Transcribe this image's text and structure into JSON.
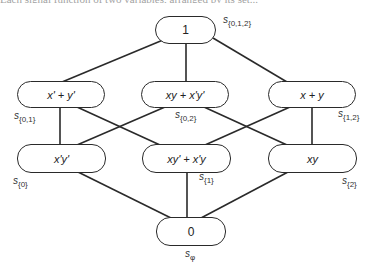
{
  "header_fragment": "Each signal function of two variables, arranged by its set...",
  "diagram": {
    "type": "lattice",
    "nodes": [
      {
        "id": "top",
        "text": "1",
        "label_base": "s",
        "label_sub": "{0,1,2}"
      },
      {
        "id": "m_left",
        "text": "x' + y'",
        "label_base": "s",
        "label_sub": "{0,1}"
      },
      {
        "id": "m_center",
        "text": "xy + x'y'",
        "label_base": "s",
        "label_sub": "{0,2}"
      },
      {
        "id": "m_right",
        "text": "x + y",
        "label_base": "s",
        "label_sub": "{1,2}"
      },
      {
        "id": "b_left",
        "text": "x'y'",
        "label_base": "s",
        "label_sub": "{0}"
      },
      {
        "id": "b_center",
        "text": "xy' + x'y",
        "label_base": "s",
        "label_sub": "{1}"
      },
      {
        "id": "b_right",
        "text": "xy",
        "label_base": "s",
        "label_sub": "{2}"
      },
      {
        "id": "bottom",
        "text": "0",
        "label_base": "s",
        "label_sub": "φ"
      }
    ],
    "edges": [
      [
        "top",
        "m_left"
      ],
      [
        "top",
        "m_center"
      ],
      [
        "top",
        "m_right"
      ],
      [
        "m_left",
        "b_left"
      ],
      [
        "m_left",
        "b_center"
      ],
      [
        "m_center",
        "b_left"
      ],
      [
        "m_center",
        "b_right"
      ],
      [
        "m_right",
        "b_center"
      ],
      [
        "m_right",
        "b_right"
      ],
      [
        "b_left",
        "bottom"
      ],
      [
        "b_center",
        "bottom"
      ],
      [
        "b_right",
        "bottom"
      ]
    ],
    "colors": {
      "stroke": "#2a2a2a",
      "background": "#ffffff"
    }
  }
}
